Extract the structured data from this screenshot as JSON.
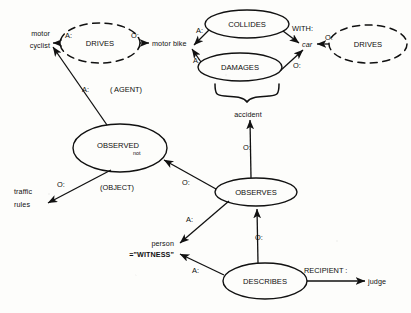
{
  "diagram": {
    "type": "semantic-network",
    "stroke_color": "#111111",
    "background_color": "#fdfdfb",
    "concepts": [
      {
        "id": "motor-cyclist",
        "label": "motor",
        "label2": "cyclist",
        "x": 50,
        "y": 39,
        "align": "right",
        "shape": "text"
      },
      {
        "id": "motor-bike",
        "label": "motor bike",
        "x": 152,
        "y": 43,
        "align": "left",
        "shape": "text"
      },
      {
        "id": "car",
        "label": "car",
        "x": 302,
        "y": 44,
        "align": "left",
        "shape": "text"
      },
      {
        "id": "accident",
        "label": "accident",
        "x": 248,
        "y": 114,
        "align": "center",
        "shape": "text"
      },
      {
        "id": "traffic-rules",
        "label": "traffic",
        "label2": "rules",
        "x": 14,
        "y": 197,
        "align": "left",
        "shape": "text"
      },
      {
        "id": "person-witness",
        "label": "person",
        "label2": "=\"WITNESS\"",
        "x": 172,
        "y": 248,
        "align": "right",
        "shape": "text"
      },
      {
        "id": "judge",
        "label": "judge",
        "x": 368,
        "y": 281,
        "align": "left",
        "shape": "text"
      }
    ],
    "relations": [
      {
        "id": "drives-left",
        "label": "DRIVES",
        "cx": 100,
        "cy": 43,
        "rx": 40,
        "ry": 20,
        "border": "dashed"
      },
      {
        "id": "collides",
        "label": "COLLIDES",
        "cx": 247,
        "cy": 24,
        "rx": 42,
        "ry": 14,
        "border": "solid"
      },
      {
        "id": "damages",
        "label": "DAMAGES",
        "cx": 240,
        "cy": 67,
        "rx": 42,
        "ry": 14,
        "border": "solid"
      },
      {
        "id": "drives-right",
        "label": "DRIVES",
        "cx": 368,
        "cy": 44,
        "rx": 39,
        "ry": 19,
        "border": "dashed"
      },
      {
        "id": "observed",
        "label": "OBSERVED",
        "sub": "not",
        "cx": 120,
        "cy": 148,
        "rx": 47,
        "ry": 24,
        "border": "solid"
      },
      {
        "id": "observes",
        "label": "OBSERVES",
        "cx": 256,
        "cy": 192,
        "rx": 41,
        "ry": 14,
        "border": "solid"
      },
      {
        "id": "describes",
        "label": "DESCRIBES",
        "cx": 265,
        "cy": 281,
        "rx": 42,
        "ry": 18,
        "border": "solid"
      }
    ],
    "arc_labels": [
      {
        "id": "arc-drives-agent",
        "text": "A:",
        "x": 65,
        "y": 36
      },
      {
        "id": "arc-drives-object",
        "text": "O:",
        "x": 131,
        "y": 36
      },
      {
        "id": "arc-collides-agent",
        "text": "A:",
        "x": 196,
        "y": 31
      },
      {
        "id": "arc-collides-with",
        "text": "WITH:",
        "x": 292,
        "y": 29
      },
      {
        "id": "arc-damages-agent",
        "text": "A:",
        "x": 193,
        "y": 61
      },
      {
        "id": "arc-damages-object",
        "text": "O:",
        "x": 293,
        "y": 66
      },
      {
        "id": "arc-drives-right-object",
        "text": "O:",
        "x": 325,
        "y": 38
      },
      {
        "id": "arc-observed-agent",
        "text": "A:",
        "x": 82,
        "y": 90
      },
      {
        "id": "arc-agent-note",
        "text": "( AGENT)",
        "x": 110,
        "y": 90
      },
      {
        "id": "arc-observed-object",
        "text": "O:",
        "x": 57,
        "y": 185
      },
      {
        "id": "arc-object-note",
        "text": "(OBJECT)",
        "x": 100,
        "y": 188
      },
      {
        "id": "arc-observes-observed",
        "text": "O:",
        "x": 182,
        "y": 183
      },
      {
        "id": "arc-observes-accident",
        "text": "O:",
        "x": 243,
        "y": 148
      },
      {
        "id": "arc-observes-agent",
        "text": "A:",
        "x": 186,
        "y": 220
      },
      {
        "id": "arc-describes-object",
        "text": "O:",
        "x": 255,
        "y": 238
      },
      {
        "id": "arc-describes-agent",
        "text": "A:",
        "x": 192,
        "y": 271
      },
      {
        "id": "arc-describes-recipient",
        "text": "RECIPIENT :",
        "x": 304,
        "y": 271
      }
    ]
  }
}
